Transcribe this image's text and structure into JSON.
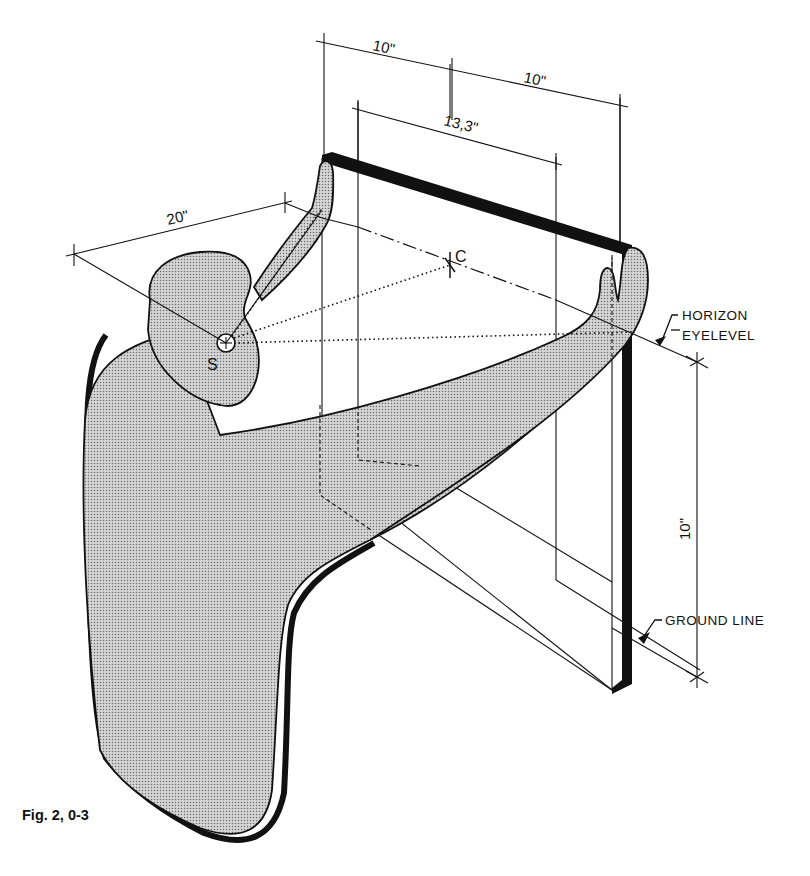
{
  "figure": {
    "caption": "Fig. 2, 0-3",
    "labels": {
      "station_point": "S",
      "center_of_vision": "C",
      "horizon": "HORIZON",
      "eyelevel": "EYELEVEL",
      "ground_line": "GROUND LINE"
    },
    "dimensions": {
      "top_left": "10\"",
      "top_right": "10\"",
      "inner_width": "13,3\"",
      "viewing_distance": "20\"",
      "eye_height": "10\""
    },
    "colors": {
      "ink": "#111111",
      "fill_screen": "#bdbdbd",
      "paper": "#ffffff"
    }
  }
}
